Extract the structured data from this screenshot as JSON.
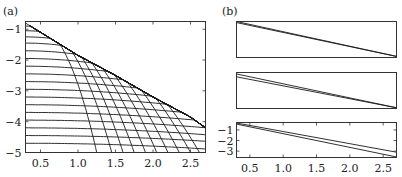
{
  "chart_data": [
    {
      "panel": "a",
      "type": "line",
      "title": "(a)",
      "xlabel": "",
      "ylabel": "",
      "xlim": [
        0.3,
        2.7
      ],
      "ylim": [
        -5,
        -0.75
      ],
      "xticks": [
        0.5,
        1.0,
        1.5,
        2.0,
        2.5
      ],
      "xtick_labels": [
        "0.5",
        "1.0",
        "1.5",
        "2.0",
        "2.5"
      ],
      "yticks": [
        -1,
        -2,
        -3,
        -4,
        -5
      ],
      "ytick_labels": [
        "−1",
        "−2",
        "−3",
        "−4",
        "−5"
      ],
      "grid": false,
      "envelope": {
        "description": "upper envelope curve",
        "x": [
          0.3,
          0.5,
          1.0,
          1.5,
          2.0,
          2.5,
          2.7
        ],
        "y": [
          -0.8,
          -1.1,
          -1.85,
          -2.5,
          -3.2,
          -3.85,
          -4.2
        ]
      },
      "horizontal_family": {
        "description": "near-horizontal curves starting at x=0.3, bending down to meet envelope",
        "start_levels": [
          -0.9,
          -1.05,
          -1.25,
          -1.45,
          -1.7,
          -1.95,
          -2.2,
          -2.45,
          -2.7,
          -2.95,
          -3.2,
          -3.45,
          -3.7,
          -3.95,
          -4.2,
          -4.45,
          -4.7
        ]
      },
      "descending_family": {
        "description": "steep arcs dropping from envelope to bottom axis",
        "bottom_x_intercepts": [
          1.25,
          1.45,
          1.6,
          1.75,
          1.9,
          2.05,
          2.2,
          2.35,
          2.5,
          2.62
        ]
      }
    },
    {
      "panel": "b",
      "type": "line",
      "title": "(b)",
      "subplots": [
        {
          "position": "top",
          "xlim": [
            0.3,
            2.7
          ],
          "show_ticks": false,
          "series": [
            {
              "name": "line1",
              "x": [
                0.3,
                2.7
              ],
              "y_frac": [
                0.03,
                0.97
              ]
            },
            {
              "name": "line2",
              "x": [
                0.3,
                2.7
              ],
              "y_frac": [
                0.0,
                0.97
              ]
            }
          ]
        },
        {
          "position": "middle",
          "xlim": [
            0.3,
            2.7
          ],
          "show_ticks": false,
          "series": [
            {
              "name": "line1",
              "x": [
                0.3,
                2.7
              ],
              "y_frac": [
                0.04,
                0.98
              ]
            },
            {
              "name": "line2",
              "x": [
                0.3,
                2.7
              ],
              "y_frac": [
                0.12,
                0.98
              ]
            }
          ]
        },
        {
          "position": "bottom",
          "xlim": [
            0.3,
            2.7
          ],
          "ylim": [
            -3.6,
            -0.3
          ],
          "xticks": [
            0.5,
            1.0,
            1.5,
            2.0,
            2.5
          ],
          "xtick_labels": [
            "0.5",
            "1.0",
            "1.5",
            "2.0",
            "2.5"
          ],
          "yticks": [
            -1,
            -2,
            -3
          ],
          "ytick_labels": [
            "−1",
            "−2",
            "−3"
          ],
          "series": [
            {
              "name": "line1",
              "x": [
                0.3,
                2.7
              ],
              "y": [
                -0.45,
                -3.55
              ]
            },
            {
              "name": "line2",
              "x": [
                0.3,
                2.7
              ],
              "y": [
                -0.35,
                -3.1
              ]
            }
          ]
        }
      ]
    }
  ],
  "labels": {
    "panel_a": "(a)",
    "panel_b": "(b)"
  }
}
